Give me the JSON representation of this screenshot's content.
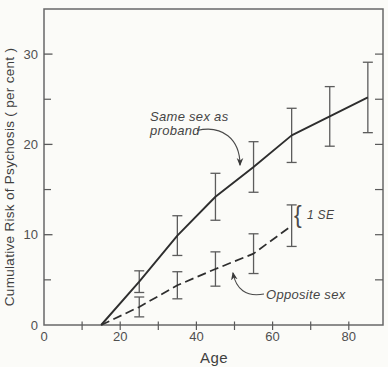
{
  "figure": {
    "y_axis_title": "Cumulative Risk of Psychosis ( per cent )",
    "x_axis_title": "Age"
  },
  "annotations": {
    "series1_label_line1": "Same sex as",
    "series1_label_line2": "proband",
    "series2_label": "Opposite sex",
    "se_label": "1 SE",
    "se_brace": "{"
  },
  "chart_data": {
    "type": "line",
    "title": "",
    "xlabel": "Age",
    "ylabel": "Cumulative Risk of Psychosis ( per cent )",
    "xlim": [
      0,
      89
    ],
    "ylim": [
      0,
      35
    ],
    "grid": false,
    "x_major_ticks": [
      0,
      20,
      40,
      60,
      80
    ],
    "x_minor_ticks": [
      10,
      30,
      50,
      70
    ],
    "y_major_ticks": [
      0,
      10,
      20,
      30
    ],
    "y_minor_ticks": [
      5,
      15,
      25
    ],
    "right_axis_ticks": [
      5,
      10,
      15,
      20,
      25,
      30
    ],
    "error_bar_meaning": "1 SE",
    "legend_position": "inline-annotations",
    "series": [
      {
        "name": "Same sex as proband",
        "style": "solid",
        "x": [
          15,
          25,
          35,
          45,
          55,
          65,
          75,
          85
        ],
        "y": [
          0,
          4.8,
          9.9,
          14.2,
          17.5,
          21.0,
          23.1,
          25.2
        ],
        "se": [
          null,
          1.2,
          2.2,
          2.6,
          2.8,
          3.0,
          3.3,
          3.9
        ]
      },
      {
        "name": "Opposite sex",
        "style": "dashed",
        "x": [
          15,
          25,
          35,
          45,
          55,
          65
        ],
        "y": [
          0,
          2.0,
          4.4,
          6.2,
          7.9,
          11.0
        ],
        "se": [
          null,
          1.1,
          1.5,
          1.9,
          2.2,
          2.3
        ]
      }
    ]
  },
  "colors": {
    "line": "#2e2e2e",
    "error_bar": "#5c5c5c",
    "frame": "#686868",
    "tick": "#5a5a5a",
    "text": "#4a4a4a",
    "background": "#fbfbf8"
  }
}
